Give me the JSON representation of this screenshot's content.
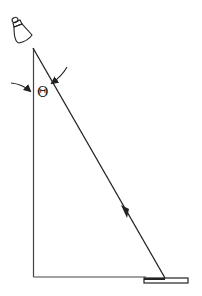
{
  "diagram": {
    "type": "ray-reflection",
    "angle_label": "Θ",
    "elements": {
      "light_source": "lamp-icon",
      "incident_ray": "arrow-down-right",
      "vertical_reference": "normal-line",
      "horizontal_baseline": "baseline",
      "mirror": "flat-rectangle"
    },
    "colors": {
      "stroke": "#222222",
      "background": "#ffffff"
    }
  }
}
